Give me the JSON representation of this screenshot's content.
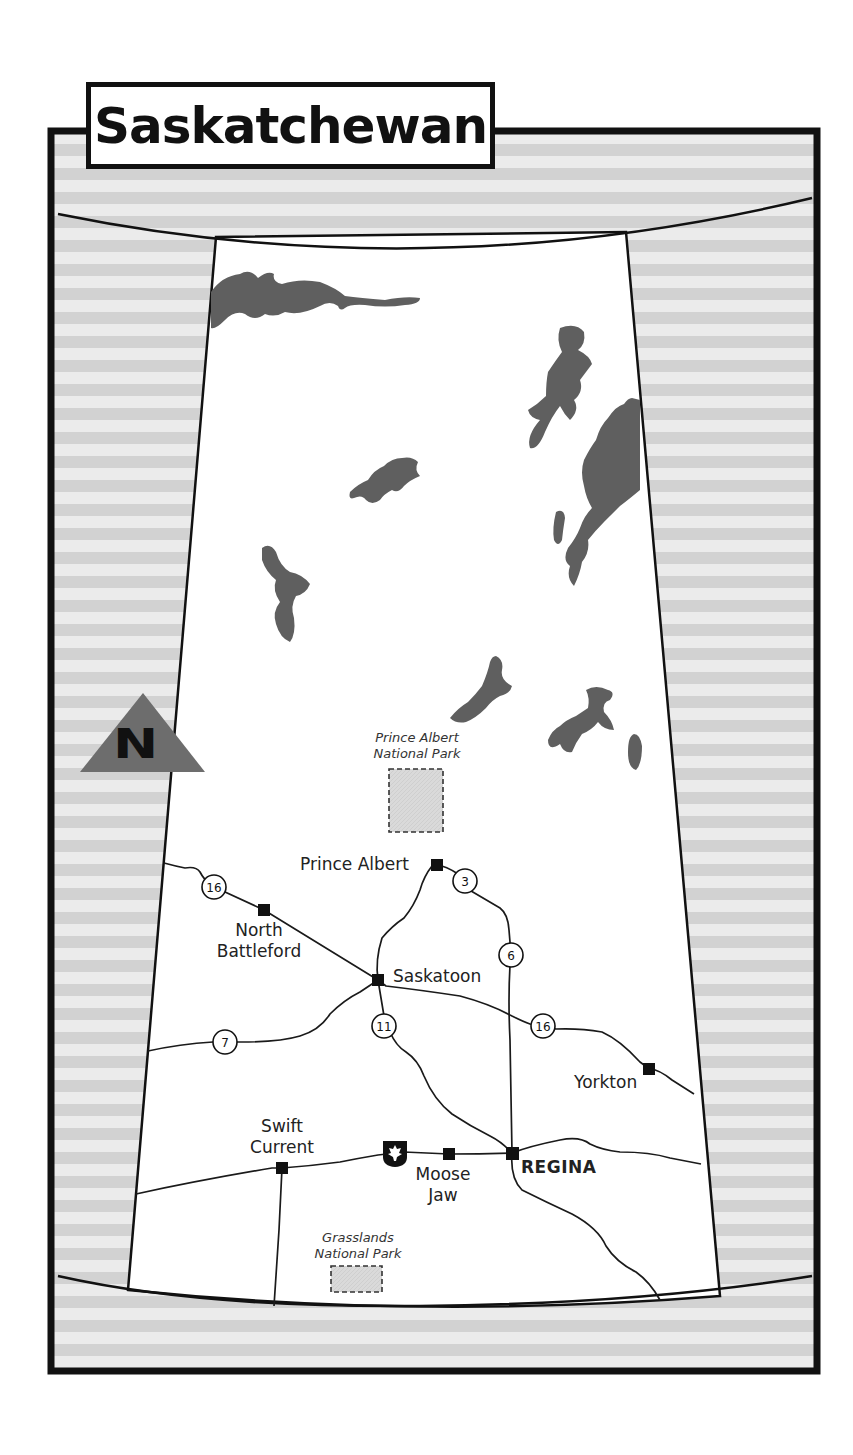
{
  "title": "Saskatchewan",
  "colors": {
    "frame": "#111111",
    "stripe_dark": "#d4d4d4",
    "stripe_light": "#ebebeb",
    "lake": "#5f5f5f",
    "park_fill": "#d8d8d8",
    "north_arrow": "#6d6d6d",
    "land": "#ffffff"
  },
  "north_arrow": {
    "letter": "N"
  },
  "parks": [
    {
      "id": "prince-albert",
      "line1": "Prince Albert",
      "line2": "National Park"
    },
    {
      "id": "grasslands",
      "line1": "Grasslands",
      "line2": "National Park"
    }
  ],
  "cities": [
    {
      "id": "prince-albert",
      "line1": "Prince Albert",
      "line2": ""
    },
    {
      "id": "north-battleford",
      "line1": "North",
      "line2": "Battleford"
    },
    {
      "id": "saskatoon",
      "line1": "Saskatoon",
      "line2": ""
    },
    {
      "id": "yorkton",
      "line1": "Yorkton",
      "line2": ""
    },
    {
      "id": "swift-current",
      "line1": "Swift",
      "line2": "Current"
    },
    {
      "id": "moose-jaw",
      "line1": "Moose",
      "line2": "Jaw"
    },
    {
      "id": "regina",
      "line1": "REGINA",
      "line2": "",
      "capital": true
    }
  ],
  "highways": [
    {
      "number": "16",
      "location": "west of North Battleford"
    },
    {
      "number": "3",
      "location": "east of Prince Albert"
    },
    {
      "number": "6",
      "location": "north of Regina"
    },
    {
      "number": "11",
      "location": "south of Saskatoon"
    },
    {
      "number": "16",
      "location": "east of Saskatoon"
    },
    {
      "number": "7",
      "location": "west of Saskatoon"
    },
    {
      "number": "1",
      "location": "Trans-Canada, west of Moose Jaw",
      "shield": "maple-leaf"
    }
  ]
}
